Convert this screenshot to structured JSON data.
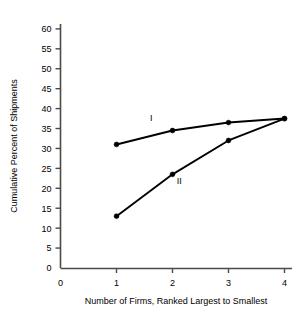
{
  "chart_data": {
    "type": "line",
    "title": "",
    "subtitle": "",
    "xlabel": "Number of Firms, Ranked Largest to Smallest",
    "ylabel": "Cumulative Percent of Shipments",
    "x": [
      1,
      2,
      3,
      4
    ],
    "xlim": [
      0,
      4
    ],
    "ylim": [
      0,
      62
    ],
    "xticks": [
      "0",
      "1",
      "2",
      "3",
      "4"
    ],
    "xtick_values": [
      0,
      1,
      2,
      3,
      4
    ],
    "yticks": [
      "0",
      "5",
      "10",
      "15",
      "20",
      "25",
      "30",
      "35",
      "40",
      "45",
      "50",
      "55",
      "60"
    ],
    "ytick_values": [
      0,
      5,
      10,
      15,
      20,
      25,
      30,
      35,
      40,
      45,
      50,
      55,
      60
    ],
    "grid": false,
    "legend_position": "inline-annotation",
    "series": [
      {
        "name": "I",
        "annotation": "I",
        "annotation_x": 1.62,
        "annotation_y": 37.0,
        "values": [
          31.0,
          34.5,
          36.5,
          37.5
        ],
        "color": "#000000",
        "marker": "circle"
      },
      {
        "name": "II",
        "annotation": "II",
        "annotation_x": 2.12,
        "annotation_y": 21.0,
        "values": [
          13.0,
          23.5,
          32.0,
          37.5
        ],
        "color": "#000000",
        "marker": "circle"
      }
    ]
  },
  "axes": {
    "y_title": "Cumulative Percent of Shipments",
    "x_title": "Number of Firms, Ranked Largest to Smallest"
  },
  "colors": {
    "line": "#000000",
    "axis": "#4a4a4a",
    "text": "#000000",
    "background": "#ffffff"
  }
}
